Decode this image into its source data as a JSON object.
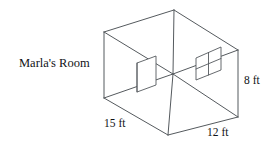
{
  "figure": {
    "title": "Marla's Room",
    "shape": "rectangular-room-3d-box",
    "labels": {
      "width": "15 ft",
      "depth": "12 ft",
      "height": "8 ft"
    },
    "fixtures": {
      "door": "door",
      "window": "window"
    },
    "colors": {
      "line": "#555a5e",
      "text": "#111316",
      "background": "#ffffff"
    }
  }
}
